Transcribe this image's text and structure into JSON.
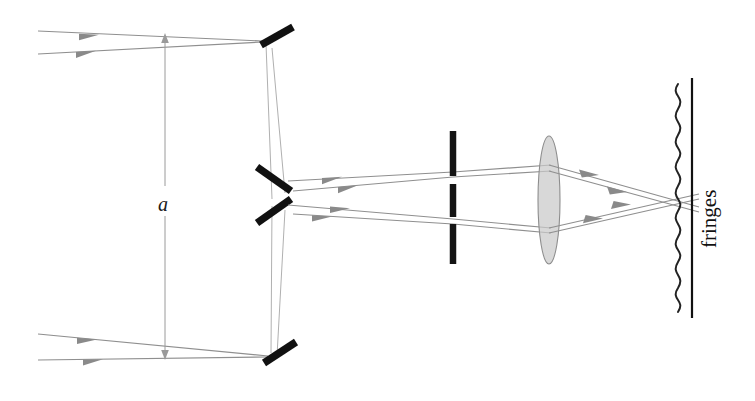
{
  "figure": {
    "domain": "Diagram",
    "background_color": "#ffffff",
    "width": 755,
    "height": 401
  },
  "labels": {
    "separation_label": "a",
    "fringes_label": "fringes"
  },
  "colors": {
    "ray": "#8f8f8f",
    "ray_faint": "#b0b0b0",
    "mirror": "#111111",
    "slit": "#141414",
    "lens_fill": "#c9c9c9",
    "lens_stroke": "#8d8d8d",
    "screen": "#111111",
    "fringe_wave": "#222222",
    "dimension": "#9a9a9a",
    "text": "#1a1a1a"
  },
  "components": {
    "mirrors": [
      {
        "name": "mirror-top",
        "x1": 262,
        "y1": 44,
        "x2": 292,
        "y2": 28,
        "orientation": "backslash-tilted"
      },
      {
        "name": "mirror-middle-upper",
        "x1": 258,
        "y1": 168,
        "x2": 290,
        "y2": 190,
        "orientation": "backslash"
      },
      {
        "name": "mirror-middle-lower",
        "x1": 258,
        "y1": 222,
        "x2": 290,
        "y2": 200,
        "orientation": "slash"
      },
      {
        "name": "mirror-bottom",
        "x1": 265,
        "y1": 362,
        "x2": 295,
        "y2": 344,
        "orientation": "slash"
      }
    ],
    "slit": {
      "name": "aperture-slit",
      "x": 453,
      "segments": [
        {
          "y1": 131,
          "y2": 176
        },
        {
          "y1": 184,
          "y2": 217
        },
        {
          "y1": 224,
          "y2": 264
        }
      ]
    },
    "lens": {
      "name": "converging-lens",
      "cx": 549,
      "cy": 200,
      "rx": 11,
      "ry": 64
    },
    "screen": {
      "name": "observation-screen",
      "x": 692,
      "y1": 78,
      "y2": 318
    },
    "fringe_wave": {
      "name": "interference-fringe-pattern",
      "x_center": 678,
      "y_top": 84,
      "y_bottom": 312,
      "amplitude": 6,
      "cycles": 9
    },
    "dimension": {
      "name": "separation-dimension",
      "x": 165,
      "y_top": 38,
      "y_bottom": 355,
      "label_x": 160,
      "label_y": 204
    }
  },
  "rays": {
    "incoming_top": [
      {
        "name": "ray-in-top-1",
        "x1": 38,
        "y1": 31,
        "x2": 262,
        "y2": 41
      },
      {
        "name": "ray-in-top-2",
        "x1": 38,
        "y1": 54,
        "x2": 262,
        "y2": 42
      }
    ],
    "incoming_bottom": [
      {
        "name": "ray-in-bottom-1",
        "x1": 38,
        "y1": 334,
        "x2": 268,
        "y2": 356
      },
      {
        "name": "ray-in-bottom-2",
        "x1": 38,
        "y1": 360,
        "x2": 268,
        "y2": 357
      }
    ],
    "vertical_top_fold": [
      {
        "name": "ray-fold-top-a",
        "x1": 265,
        "y1": 44,
        "x2": 272,
        "y2": 196
      },
      {
        "name": "ray-fold-top-b",
        "x1": 271,
        "y1": 47,
        "x2": 283,
        "y2": 192
      }
    ],
    "vertical_bottom_fold": [
      {
        "name": "ray-fold-bottom-a",
        "x1": 272,
        "y1": 206,
        "x2": 272,
        "y2": 354
      },
      {
        "name": "ray-fold-bottom-b",
        "x1": 283,
        "y1": 210,
        "x2": 277,
        "y2": 356
      }
    ],
    "beam_to_slit": [
      {
        "name": "ray-beam-1",
        "x1": 288,
        "y1": 181,
        "x2": 453,
        "y2": 172
      },
      {
        "name": "ray-beam-2",
        "x1": 292,
        "y1": 190,
        "x2": 453,
        "y2": 177
      },
      {
        "name": "ray-beam-3",
        "x1": 288,
        "y1": 205,
        "x2": 453,
        "y2": 219
      },
      {
        "name": "ray-beam-4",
        "x1": 292,
        "y1": 214,
        "x2": 453,
        "y2": 224
      }
    ],
    "beam_to_lens": [
      {
        "name": "ray-slit-to-lens-1",
        "x1": 453,
        "y1": 172,
        "x2": 549,
        "y2": 165
      },
      {
        "name": "ray-slit-to-lens-2",
        "x1": 453,
        "y1": 177,
        "x2": 549,
        "y2": 171
      },
      {
        "name": "ray-slit-to-lens-3",
        "x1": 453,
        "y1": 219,
        "x2": 549,
        "y2": 228
      },
      {
        "name": "ray-slit-to-lens-4",
        "x1": 453,
        "y1": 224,
        "x2": 549,
        "y2": 233
      }
    ],
    "beam_to_screen": [
      {
        "name": "ray-lens-to-screen-1",
        "x1": 549,
        "y1": 165,
        "x2": 697,
        "y2": 207
      },
      {
        "name": "ray-lens-to-screen-2",
        "x1": 549,
        "y1": 171,
        "x2": 697,
        "y2": 212
      },
      {
        "name": "ray-lens-to-screen-3",
        "x1": 549,
        "y1": 228,
        "x2": 697,
        "y2": 194
      },
      {
        "name": "ray-lens-to-screen-4",
        "x1": 549,
        "y1": 233,
        "x2": 697,
        "y2": 199
      }
    ]
  }
}
